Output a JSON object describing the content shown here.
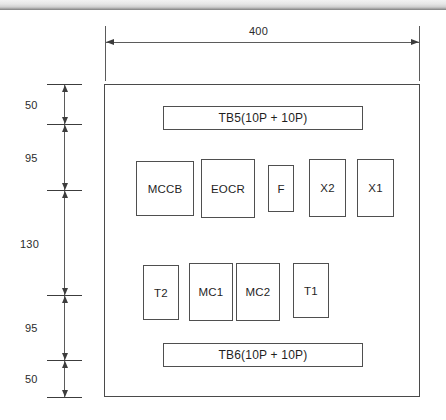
{
  "drawing": {
    "title": "Enclosure component layout",
    "background_color": "#ffffff",
    "line_color": "#4f4f4f",
    "text_color": "#1f1f1f"
  },
  "dimensions": {
    "width_label": "400",
    "height_chain": [
      {
        "label": "50"
      },
      {
        "label": "95"
      },
      {
        "label": "130"
      },
      {
        "label": "95"
      },
      {
        "label": "50"
      }
    ]
  },
  "components": {
    "top_terminal_block": {
      "label": "TB5(10P + 10P)"
    },
    "bottom_terminal_block": {
      "label": "TB6(10P + 10P)"
    },
    "middle_row": [
      {
        "label": "MCCB"
      },
      {
        "label": "EOCR"
      },
      {
        "label": "F"
      },
      {
        "label": "X2"
      },
      {
        "label": "X1"
      }
    ],
    "lower_row": [
      {
        "label": "T2"
      },
      {
        "label": "MC1"
      },
      {
        "label": "MC2"
      },
      {
        "label": "T1"
      }
    ]
  }
}
